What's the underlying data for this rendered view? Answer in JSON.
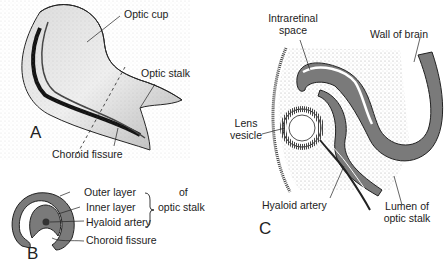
{
  "figure": {
    "panels": {
      "A": {
        "letter": "A",
        "labels": {
          "optic_cup": "Optic cup",
          "optic_stalk": "Optic stalk",
          "choroid_fissure": "Choroid fissure"
        }
      },
      "B": {
        "letter": "B",
        "labels": {
          "outer_layer": "Outer layer",
          "inner_layer": "Inner layer",
          "of_optic_stalk_1": "of",
          "of_optic_stalk_2": "optic stalk",
          "hyaloid_artery": "Hyaloid artery",
          "choroid_fissure": "Choroid fissure"
        }
      },
      "C": {
        "letter": "C",
        "labels": {
          "intraretinal_1": "Intraretinal",
          "intraretinal_2": "space",
          "wall_of_brain": "Wall of brain",
          "lens_1": "Lens",
          "lens_2": "vesicle",
          "hyaloid_artery": "Hyaloid artery",
          "lumen_1": "Lumen of",
          "lumen_2": "optic stalk"
        }
      }
    },
    "colors": {
      "fill_gray": "#7a7a7a",
      "stipple": "#bdbdbd",
      "line": "#222222"
    }
  }
}
